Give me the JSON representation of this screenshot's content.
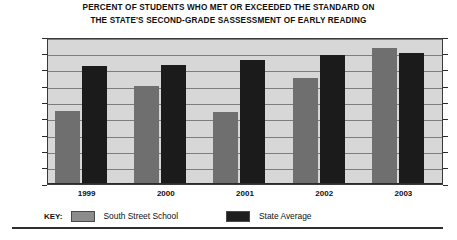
{
  "chart_data": {
    "type": "bar",
    "title": "PERCENT OF STUDENTS WHO MET OR EXCEEDED THE STANDARD ON THE STATE'S SECOND-GRADE SASSESSMENT OF EARLY READING",
    "title_lines": [
      "PERCENT OF STUDENTS WHO MET OR EXCEEDED THE STANDARD ON",
      "THE STATE'S SECOND-GRADE SASSESSMENT OF EARLY READING"
    ],
    "categories": [
      "1999",
      "2000",
      "2001",
      "2002",
      "2003"
    ],
    "series": [
      {
        "name": "South Street School",
        "color": "#6f6f6f",
        "values": [
          45,
          60,
          44,
          65,
          83
        ]
      },
      {
        "name": "State Average",
        "color": "#1b1b1b",
        "values": [
          72,
          73,
          76,
          79,
          80
        ]
      }
    ],
    "xlabel": "",
    "ylabel": "",
    "ylim": [
      0,
      90
    ],
    "ytick_labels": [
      "90%",
      "80%",
      "70%",
      "60%",
      "50%",
      "40%",
      "30%",
      "20%",
      "10%",
      "0%"
    ],
    "ytick_values": [
      90,
      80,
      70,
      60,
      50,
      40,
      30,
      20,
      10,
      0
    ],
    "grid": true,
    "legend_position": "bottom-left",
    "legend_key_label": "KEY:",
    "plot_background": "#d7d7d7",
    "figure_background": "#ffffff"
  }
}
